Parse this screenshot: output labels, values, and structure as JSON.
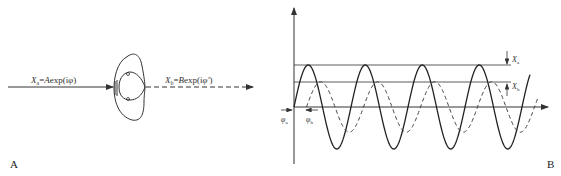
{
  "panel_a": {
    "letter": "A",
    "incoming_label": {
      "var": "X",
      "sub": "a",
      "eq": "=",
      "coef": "A",
      "func": "exp(i",
      "phase": "φ",
      "close": ")"
    },
    "outgoing_label": {
      "var": "X",
      "sub": "b",
      "eq": "=",
      "coef": "B",
      "func": "exp(i",
      "phase": "φ'",
      "close": ")"
    }
  },
  "panel_b": {
    "letter": "B",
    "amp_label_a": {
      "var": "X",
      "sub": "a"
    },
    "amp_label_b": {
      "var": "X",
      "sub": "b"
    },
    "phase_label_a": {
      "var": "φ",
      "sub": "a"
    },
    "phase_label_b": {
      "var": "φ",
      "sub": "b"
    }
  },
  "chart_data": {
    "type": "line",
    "title": "",
    "xlabel": "",
    "ylabel": "",
    "grid": false,
    "series": [
      {
        "name": "X_a (solid)",
        "style": "solid",
        "amplitude": 1.0,
        "periods": 4.2,
        "phase_offset_periods": 0
      },
      {
        "name": "X_b (dashed)",
        "style": "dashed",
        "amplitude": 0.6,
        "periods": 4.2,
        "phase_offset_periods": 0.22
      }
    ],
    "reference_lines": [
      {
        "label": "X_a",
        "value": 1.0
      },
      {
        "label": "X_b",
        "value": 0.6
      }
    ]
  }
}
